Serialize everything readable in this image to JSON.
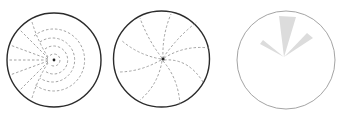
{
  "colors": {
    "background": "#ffffff",
    "circle_stroke_dark": "#2b2b2b",
    "circle_stroke_light": "#9a9a9a",
    "dash_stroke": "#8c8c8c",
    "wedge_fill": "#dcdcdc",
    "center_dot": "#222222"
  },
  "panels": [
    {
      "id": "concentric-field",
      "description": "Circle with concentric dashed arcs around a point and radial dashed lines to the left",
      "center": [
        54,
        60
      ],
      "radius": 47,
      "arc_radii": [
        6,
        14,
        22,
        31
      ],
      "radial_line_count": 7
    },
    {
      "id": "spiral-field",
      "description": "Circle with dashed spiral arms emanating from a central point",
      "center": [
        161.5,
        59
      ],
      "radius": 48,
      "spiral_arm_count": 9
    },
    {
      "id": "wedge-field",
      "description": "Light circle with three gray wedges from a common apex",
      "center": [
        286,
        60
      ],
      "radius": 49,
      "apex": [
        284,
        57
      ],
      "wedges": [
        {
          "name": "left-wedge",
          "angle_start_deg": 140,
          "angle_end_deg": 152,
          "length": 30
        },
        {
          "name": "top-wedge",
          "angle_start_deg": 80,
          "angle_end_deg": 100,
          "length": 42
        },
        {
          "name": "right-wedge",
          "angle_start_deg": 32,
          "angle_end_deg": 45,
          "length": 34
        }
      ]
    }
  ]
}
